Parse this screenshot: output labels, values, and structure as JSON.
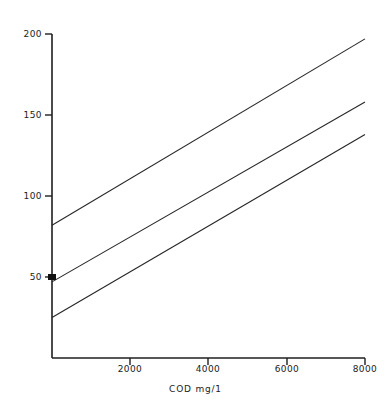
{
  "chart_data": {
    "type": "line",
    "title": "",
    "subtitle": "",
    "xlabel": "COD  mg/1",
    "ylabel": "",
    "xlim": [
      0,
      8000
    ],
    "ylim": [
      0,
      200
    ],
    "xticks": [
      0,
      2000,
      4000,
      6000,
      8000
    ],
    "xticklabels": [
      "",
      "2000",
      "4000",
      "6000",
      "8000"
    ],
    "yticks": [
      50,
      100,
      150,
      200
    ],
    "yticklabels": [
      "50",
      "100",
      "150",
      "200"
    ],
    "grid": false,
    "legend": null,
    "legend_position": "none",
    "line_color": "#262626",
    "marker": {
      "name": "origin-marker",
      "x": 0,
      "y": 50,
      "shape": "square",
      "color": "#111111"
    },
    "series": [
      {
        "name": "upper-line",
        "x": [
          0,
          8000
        ],
        "values": [
          82,
          197
        ]
      },
      {
        "name": "middle-line",
        "x": [
          0,
          8000
        ],
        "values": [
          47,
          158
        ]
      },
      {
        "name": "lower-line",
        "x": [
          0,
          8000
        ],
        "values": [
          25,
          138
        ]
      }
    ]
  },
  "axes": {
    "y_tick_labels": [
      {
        "text": "200",
        "top": 29
      },
      {
        "text": "150",
        "top": 110
      },
      {
        "text": "100",
        "top": 191
      },
      {
        "text": "50",
        "top": 272
      }
    ],
    "x_tick_labels": [
      {
        "text": "2000",
        "left": 114
      },
      {
        "text": "4000",
        "left": 192
      },
      {
        "text": "6000",
        "left": 271
      },
      {
        "text": "8000",
        "left": 350
      }
    ],
    "x_axis_title": "COD  mg/1"
  }
}
